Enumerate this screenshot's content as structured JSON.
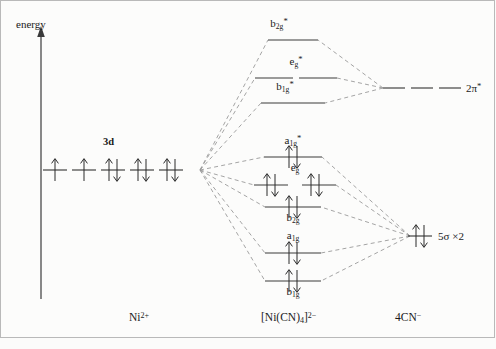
{
  "figure": {
    "type": "molecular-orbital-energy-level-diagram",
    "axis": {
      "label": "energy",
      "direction": "up",
      "arrow": true
    },
    "background": "#fcfcfb",
    "colors": {
      "level_line": "#3b3b3b",
      "correlation_line": "#8a8a8a",
      "text": "#1a1a1a",
      "frame": "#b9b9b9"
    },
    "fragments": [
      {
        "id": "left",
        "label_html": "Ni<sup>2+</sup>",
        "label_plain": "Ni2+",
        "x": 147
      },
      {
        "id": "center",
        "label_html": "[Ni(CN)<sub>4</sub>]<sup>2−</sup>",
        "label_plain": "[Ni(CN)4]2-",
        "x": 297
      },
      {
        "id": "right",
        "label_html": "4CN<sup>−</sup>",
        "label_plain": "4CN-",
        "x": 413
      }
    ],
    "left_fragment": {
      "shell_tag": "3d",
      "shell_tag_x": 112,
      "shell_tag_y": 142,
      "orbital_count": 5,
      "orbitals": [
        {
          "x": 55,
          "y": 170,
          "electrons": 1
        },
        {
          "x": 84,
          "y": 170,
          "electrons": 1
        },
        {
          "x": 113,
          "y": 170,
          "electrons": 2
        },
        {
          "x": 142,
          "y": 170,
          "electrons": 2
        },
        {
          "x": 171,
          "y": 170,
          "electrons": 2
        }
      ],
      "convergence_point": {
        "x": 200,
        "y": 170
      }
    },
    "center_levels": [
      {
        "name": "b2g*",
        "label_html": "b<sub>2g</sub><sup>*</sup>",
        "label_plain": "b2g*",
        "y": 40,
        "label_pos": "above",
        "label_y": 22,
        "electrons": 0,
        "segments": [
          [
            268,
            318
          ]
        ]
      },
      {
        "name": "eg*",
        "label_html": "e<sub>g</sub><sup>*</sup>",
        "label_plain": "eg*",
        "y": 78,
        "label_pos": "above",
        "label_y": 60,
        "electrons": 0,
        "degeneracy": 2,
        "segments": [
          [
            255,
            293
          ],
          [
            299,
            337
          ]
        ]
      },
      {
        "name": "b1g*",
        "label_html": "b<sub>1g</sub><sup>*</sup>",
        "label_plain": "b1g*",
        "y": 103,
        "label_pos": "above",
        "label_y": 85,
        "electrons": 0,
        "segments": [
          [
            261,
            325
          ]
        ]
      },
      {
        "name": "a1g*",
        "label_html": "a<sub>1g</sub><sup>*</sup>",
        "label_plain": "a1g*",
        "y": 157,
        "label_pos": "above",
        "label_y": 139,
        "electrons": 2,
        "segments": [
          [
            264,
            322
          ]
        ]
      },
      {
        "name": "eg",
        "label_html": "e<sub>g</sub>",
        "label_plain": "eg",
        "y": 185,
        "label_pos": "above",
        "label_y": 167,
        "electrons": 2,
        "degeneracy": 2,
        "segments": [
          [
            254,
            288
          ],
          [
            302,
            336
          ]
        ]
      },
      {
        "name": "b2g",
        "label_html": "b<sub>2g</sub>",
        "label_plain": "b2g",
        "y": 207,
        "label_pos": "below",
        "label_y": 211,
        "electrons": 2,
        "segments": [
          [
            265,
            321
          ]
        ]
      },
      {
        "name": "a1g",
        "label_html": "a<sub>1g</sub>",
        "label_plain": "a1g",
        "y": 253,
        "label_pos": "above",
        "label_y": 235,
        "electrons": 2,
        "segments": [
          [
            265,
            321
          ]
        ]
      },
      {
        "name": "b1g",
        "label_html": "b<sub>1g</sub>",
        "label_plain": "b1g",
        "y": 281,
        "label_pos": "below",
        "label_y": 285,
        "electrons": 2,
        "segments": [
          [
            265,
            321
          ]
        ]
      }
    ],
    "right_levels": [
      {
        "name": "2pi*",
        "label_html": "2π<sup>*</sup>",
        "label_plain": "2pi*",
        "y": 88,
        "electrons": 0,
        "label_x": 452,
        "segments": [
          [
            383,
            405
          ],
          [
            411,
            433
          ],
          [
            439,
            461
          ]
        ]
      },
      {
        "name": "5sigma x2",
        "label_html": "5σ ×2",
        "label_plain": "5sigma x2",
        "y": 236,
        "electrons": 2,
        "label_x": 442,
        "orbital_x": 420,
        "segments": []
      }
    ],
    "correlation_lines": {
      "style": "dashed",
      "from_left_point": {
        "x": 200,
        "y": 170
      },
      "from_right_2pi": {
        "x": 383,
        "y": 88
      },
      "from_right_5sigma": {
        "x": 410,
        "y": 236
      },
      "left_to_center_targets": [
        "b2g*",
        "eg*",
        "b1g*",
        "a1g*",
        "eg",
        "b2g",
        "a1g",
        "b1g"
      ],
      "right_2pi_to_center_targets": [
        "b2g*",
        "eg*",
        "b1g*"
      ],
      "right_5sigma_to_center_targets": [
        "a1g*",
        "eg",
        "b2g",
        "a1g",
        "b1g"
      ]
    }
  }
}
